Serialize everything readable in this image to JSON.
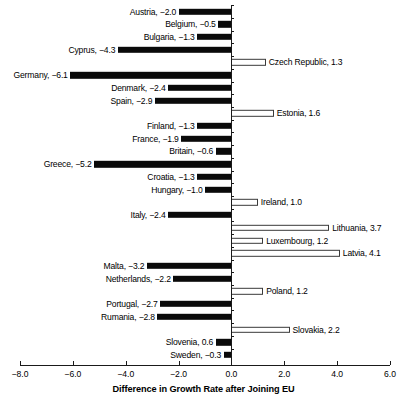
{
  "chart_data": {
    "type": "bar",
    "orientation": "horizontal",
    "title": "",
    "xlabel": "Difference in Growth Rate after Joining EU",
    "ylabel": "",
    "xlim": [
      -8.0,
      6.0
    ],
    "xticks": [
      "-8.0",
      "-6.0",
      "-4.0",
      "-2.0",
      "0.0",
      "2.0",
      "4.0",
      "6.0"
    ],
    "xtick_values": [
      -8.0,
      -6.0,
      -4.0,
      -2.0,
      0.0,
      2.0,
      4.0,
      6.0
    ],
    "grid": false,
    "legend": "none",
    "categories": [
      "Austria",
      "Belgium",
      "Bulgaria",
      "Cyprus",
      "Czech Republic",
      "Germany",
      "Denmark",
      "Spain",
      "Estonia",
      "Finland",
      "France",
      "Britain",
      "Greece",
      "Croatia",
      "Hungary",
      "Ireland",
      "Italy",
      "Lithuania",
      "Luxembourg",
      "Latvia",
      "Malta",
      "Netherlands",
      "Poland",
      "Portugal",
      "Rumania",
      "Slovakia",
      "Slovenia",
      "Sweden"
    ],
    "values": [
      -2.0,
      -0.5,
      -1.3,
      -4.3,
      1.3,
      -6.1,
      -2.4,
      -2.9,
      1.6,
      -1.3,
      -1.9,
      -0.6,
      -5.2,
      -1.3,
      -1.0,
      1.0,
      -2.4,
      3.7,
      1.2,
      4.1,
      -3.2,
      -2.2,
      1.2,
      -2.7,
      -2.8,
      2.2,
      -0.6,
      -0.3
    ],
    "bars": [
      {
        "label": "Austria, −2.0",
        "country": "Austria",
        "value": -2.0,
        "sign": "neg"
      },
      {
        "label": "Belgium, −0.5",
        "country": "Belgium",
        "value": -0.5,
        "sign": "neg"
      },
      {
        "label": "Bulgaria, −1.3",
        "country": "Bulgaria",
        "value": -1.3,
        "sign": "neg"
      },
      {
        "label": "Cyprus, −4.3",
        "country": "Cyprus",
        "value": -4.3,
        "sign": "neg"
      },
      {
        "label": "Czech Republic, 1.3",
        "country": "Czech Republic",
        "value": 1.3,
        "sign": "pos"
      },
      {
        "label": "Germany, −6.1",
        "country": "Germany",
        "value": -6.1,
        "sign": "neg"
      },
      {
        "label": "Denmark, −2.4",
        "country": "Denmark",
        "value": -2.4,
        "sign": "neg"
      },
      {
        "label": "Spain, −2.9",
        "country": "Spain",
        "value": -2.9,
        "sign": "neg"
      },
      {
        "label": "Estonia, 1.6",
        "country": "Estonia",
        "value": 1.6,
        "sign": "pos"
      },
      {
        "label": "Finland, −1.3",
        "country": "Finland",
        "value": -1.3,
        "sign": "neg"
      },
      {
        "label": "France, −1.9",
        "country": "France",
        "value": -1.9,
        "sign": "neg"
      },
      {
        "label": "Britain, −0.6",
        "country": "Britain",
        "value": -0.6,
        "sign": "neg"
      },
      {
        "label": "Greece, −5.2",
        "country": "Greece",
        "value": -5.2,
        "sign": "neg"
      },
      {
        "label": "Croatia, −1.3",
        "country": "Croatia",
        "value": -1.3,
        "sign": "neg"
      },
      {
        "label": "Hungary, −1.0",
        "country": "Hungary",
        "value": -1.0,
        "sign": "neg"
      },
      {
        "label": "Ireland, 1.0",
        "country": "Ireland",
        "value": 1.0,
        "sign": "pos"
      },
      {
        "label": "Italy, −2.4",
        "country": "Italy",
        "value": -2.4,
        "sign": "neg"
      },
      {
        "label": "Lithuania, 3.7",
        "country": "Lithuania",
        "value": 3.7,
        "sign": "pos"
      },
      {
        "label": "Luxembourg, 1.2",
        "country": "Luxembourg",
        "value": 1.2,
        "sign": "pos"
      },
      {
        "label": "Latvia, 4.1",
        "country": "Latvia",
        "value": 4.1,
        "sign": "pos"
      },
      {
        "label": "Malta, −3.2",
        "country": "Malta",
        "value": -3.2,
        "sign": "neg"
      },
      {
        "label": "Netherlands, −2.2",
        "country": "Netherlands",
        "value": -2.2,
        "sign": "neg"
      },
      {
        "label": "Poland, 1.2",
        "country": "Poland",
        "value": 1.2,
        "sign": "pos"
      },
      {
        "label": "Portugal, −2.7",
        "country": "Portugal",
        "value": -2.7,
        "sign": "neg"
      },
      {
        "label": "Rumania, −2.8",
        "country": "Rumania",
        "value": -2.8,
        "sign": "neg"
      },
      {
        "label": "Slovakia, 2.2",
        "country": "Slovakia",
        "value": 2.2,
        "sign": "pos"
      },
      {
        "label": "Slovenia,  0.6",
        "country": "Slovenia",
        "value": -0.6,
        "sign": "neg"
      },
      {
        "label": "Sweden, −0.3",
        "country": "Sweden",
        "value": -0.3,
        "sign": "neg"
      }
    ]
  },
  "colors": {
    "negative_bar": "#0a0a0a",
    "positive_bar_fill": "#ffffff",
    "positive_bar_stroke": "#3a3a3a",
    "axis": "#1a1a1a",
    "background": "#ffffff"
  }
}
